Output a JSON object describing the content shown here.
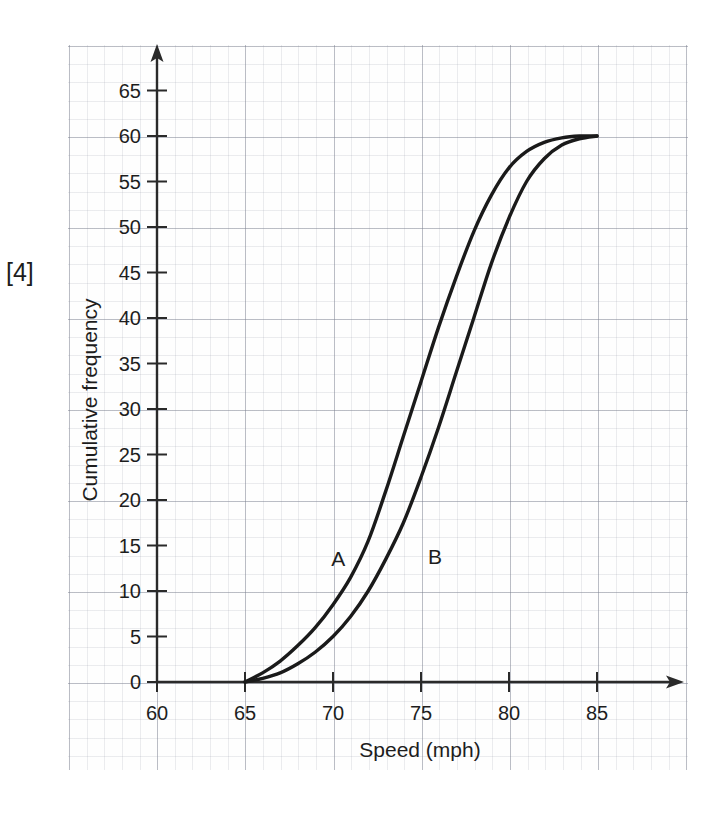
{
  "question": {
    "marks_label": "[4]"
  },
  "chart_data": {
    "type": "line",
    "title": "",
    "subtitle": "",
    "xlabel": "Speed (mph)",
    "ylabel": "Cumulative frequency",
    "xlim": [
      58,
      89
    ],
    "ylim": [
      0,
      68
    ],
    "xticks": [
      60,
      65,
      70,
      75,
      80,
      85
    ],
    "xtick_labels": [
      "60",
      "65",
      "70",
      "75",
      "80",
      "85"
    ],
    "yticks": [
      0,
      5,
      10,
      15,
      20,
      25,
      30,
      35,
      40,
      45,
      50,
      55,
      60,
      65
    ],
    "ytick_labels": [
      "0",
      "5",
      "10",
      "15",
      "20",
      "25",
      "30",
      "35",
      "40",
      "45",
      "50",
      "55",
      "60",
      "65"
    ],
    "grid": true,
    "grid_style": "graph-paper",
    "legend_position": "inline-annotation",
    "axis_arrows": true,
    "series": [
      {
        "name": "A",
        "label": "A",
        "annotation": "A",
        "annotation_x": 70.3,
        "annotation_y": 13.5,
        "color": "#1a1a1a",
        "x": [
          65,
          66,
          67,
          68,
          69,
          70,
          71,
          72,
          73,
          74,
          75,
          76,
          77,
          78,
          79,
          80,
          81,
          82,
          83,
          84,
          85
        ],
        "y": [
          0,
          1,
          2.3,
          4,
          6,
          8.5,
          11.5,
          15.5,
          21,
          27,
          33,
          39,
          44.5,
          49.5,
          53.5,
          56.5,
          58.3,
          59.3,
          59.8,
          60,
          60
        ]
      },
      {
        "name": "B",
        "label": "B",
        "annotation": "B",
        "annotation_x": 75.8,
        "annotation_y": 13.7,
        "color": "#1a1a1a",
        "x": [
          65,
          66,
          67,
          68,
          69,
          70,
          71,
          72,
          73,
          74,
          75,
          76,
          77,
          78,
          79,
          80,
          81,
          82,
          83,
          84,
          85
        ],
        "y": [
          0,
          0.4,
          1,
          2,
          3.3,
          5,
          7.2,
          10,
          13.5,
          17.5,
          22.5,
          28,
          34,
          40,
          46,
          51,
          55,
          57.5,
          59,
          59.7,
          60
        ]
      }
    ]
  },
  "axes": {
    "x_axis_name": "x-axis",
    "y_axis_name": "y-axis"
  }
}
